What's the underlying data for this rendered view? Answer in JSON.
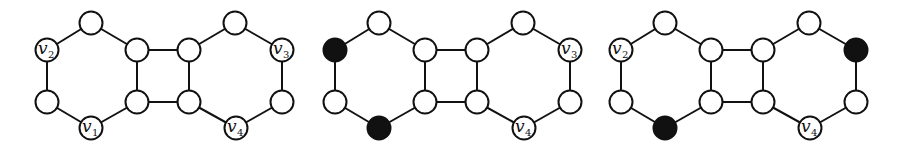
{
  "figure": {
    "colors": {
      "edge": "#111111",
      "node_fill": "#ffffff",
      "selected_fill": "#111111"
    },
    "panels": [
      {
        "id": "panel-1",
        "offset_x": 0,
        "labels": {
          "n1": "v|2",
          "n3": "v|1",
          "n9": "v|3",
          "n11": "v|4"
        },
        "selected": []
      },
      {
        "id": "panel-2",
        "offset_x": 288,
        "labels": {
          "n1": "v|2",
          "n3": "v|1",
          "n9": "v|3",
          "n11": "v|4"
        },
        "selected": [
          "n1",
          "n3"
        ]
      },
      {
        "id": "panel-3",
        "offset_x": 574,
        "labels": {
          "n1": "v|2",
          "n3": "v|1",
          "n9": "v|3",
          "n11": "v|4"
        },
        "selected": [
          "n3",
          "n9"
        ]
      }
    ],
    "nodes": [
      {
        "id": "n0",
        "x": 91,
        "y": 23
      },
      {
        "id": "n1",
        "x": 47,
        "y": 50
      },
      {
        "id": "n2",
        "x": 47,
        "y": 102
      },
      {
        "id": "n3",
        "x": 91,
        "y": 128
      },
      {
        "id": "n4",
        "x": 137,
        "y": 50
      },
      {
        "id": "n5",
        "x": 137,
        "y": 102
      },
      {
        "id": "n6",
        "x": 189,
        "y": 50
      },
      {
        "id": "n7",
        "x": 189,
        "y": 102
      },
      {
        "id": "n8",
        "x": 235,
        "y": 23
      },
      {
        "id": "n9",
        "x": 282,
        "y": 50
      },
      {
        "id": "n10",
        "x": 282,
        "y": 102
      },
      {
        "id": "n11",
        "x": 236,
        "y": 128
      }
    ],
    "edges": [
      [
        "n0",
        "n1"
      ],
      [
        "n1",
        "n2"
      ],
      [
        "n2",
        "n3"
      ],
      [
        "n3",
        "n5"
      ],
      [
        "n5",
        "n4"
      ],
      [
        "n4",
        "n0"
      ],
      [
        "n4",
        "n6"
      ],
      [
        "n5",
        "n7"
      ],
      [
        "n6",
        "n7"
      ],
      [
        "n6",
        "n8"
      ],
      [
        "n8",
        "n9"
      ],
      [
        "n9",
        "n10"
      ],
      [
        "n10",
        "n11"
      ],
      [
        "n11",
        "n7"
      ]
    ],
    "node_radius": 11.5
  }
}
